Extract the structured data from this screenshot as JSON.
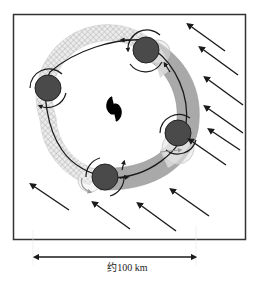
{
  "diagram": {
    "title": "",
    "scale_label": "约100 km",
    "colors": {
      "frame": "#333333",
      "vortex_fill": "#4a4a4a",
      "hatched_band": "#bdbdbd",
      "gray_band": "#a9a9a9",
      "light_band": "#d6d6d6",
      "arrow": "#1a1a1a"
    },
    "elements": {
      "center_symbol": "typhoon-symbol",
      "vortices": 4,
      "environmental_wind_arrows": 11
    }
  }
}
